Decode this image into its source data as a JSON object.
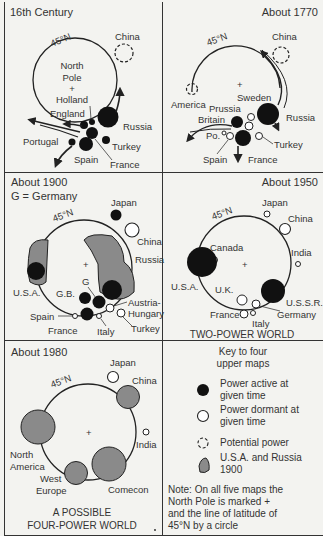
{
  "panels": {
    "p1": {
      "title": "16th Century",
      "lat": "45°N",
      "pole_lines": [
        "North",
        "Pole",
        "+",
        "Holland"
      ],
      "countries": {
        "china": "China",
        "england": "England",
        "russia": "Russia",
        "portugal": "Portugal",
        "turkey": "Turkey",
        "spain": "Spain",
        "france": "France"
      }
    },
    "p2": {
      "title": "About 1770",
      "lat": "45°N",
      "countries": {
        "china": "China",
        "america": "America",
        "prussia": "Prussia",
        "sweden": "Sweden",
        "britain": "Britain",
        "russia": "Russia",
        "po": "Po.",
        "turkey": "Turkey",
        "spain": "Spain",
        "france": "France"
      }
    },
    "p3": {
      "title": "About 1900",
      "subtitle": "G = Germany",
      "lat": "45°N",
      "countries": {
        "japan": "Japan",
        "china": "China",
        "russia": "Russia",
        "usa": "U.S.A.",
        "gb": "G.B.",
        "g": "G",
        "austria1": "Austria-",
        "austria2": "Hungary",
        "spain": "Spain",
        "france": "France",
        "italy": "Italy",
        "turkey": "Turkey"
      }
    },
    "p4": {
      "title": "About 1950",
      "lat": "45°N",
      "caption": "TWO-POWER WORLD",
      "countries": {
        "japan": "Japan",
        "china": "China",
        "canada": "Canada",
        "india": "India",
        "usa": "U.S.A.",
        "uk": "U.K.",
        "ussr": "U.S.S.R.",
        "france": "France",
        "germany": "Germany",
        "italy": "Italy"
      }
    },
    "p5": {
      "title": "About 1980",
      "lat": "45°N",
      "caption1": "A POSSIBLE",
      "caption2": "FOUR-POWER WORLD",
      "countries": {
        "japan": "Japan",
        "china": "China",
        "india": "India",
        "na1": "North",
        "na2": "America",
        "we1": "West",
        "we2": "Europe",
        "comecon": "Comecon"
      }
    }
  },
  "key": {
    "title1": "Key to four",
    "title2": "upper maps",
    "active1": "Power active at",
    "active2": "given time",
    "dormant1": "Power dormant at",
    "dormant2": "given time",
    "potential": "Potential power",
    "usa1": "U.S.A. and Russia",
    "usa2": "1900",
    "note1": "Note:  On all five maps the",
    "note2": "North Pole is marked +",
    "note3": "and the line of latitude of",
    "note4": "45°N by a circle"
  },
  "colors": {
    "active": "#111111",
    "dormant": "#ffffff",
    "superpower_area": "#8a8a8a",
    "line": "#222222"
  }
}
